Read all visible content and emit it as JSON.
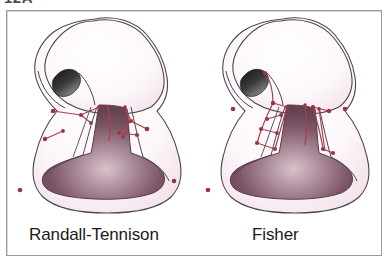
{
  "figure": {
    "caption_fragment": "12A",
    "border_color": "#9a9a9e",
    "background_color": "#ffffff"
  },
  "panels": [
    {
      "id": "randall-tennison",
      "label": "Randall-Tennison",
      "side": "left"
    },
    {
      "id": "fisher",
      "label": "Fisher",
      "side": "right"
    }
  ],
  "illustration": {
    "subject": "cleft lip repair surgical markings on nose and upper lip",
    "colors": {
      "outline": "#4a4350",
      "skin_fill": "#fdf8fa",
      "skin_shadow": "#f3e6ec",
      "oral_cavity_dark": "#6d4a58",
      "oral_cavity_light": "#cfb7c2",
      "nostril": "#2c2c2c",
      "marking_line": "#a8414d",
      "marking_dot": "#9c3340"
    },
    "parts": [
      {
        "name": "nasal-dome",
        "description": "rounded nasal tip and ala outline"
      },
      {
        "name": "nostril",
        "description": "dark left nostril opening"
      },
      {
        "name": "oral-cavity",
        "description": "shaded mouth opening with gradient"
      },
      {
        "name": "vermilion-border",
        "description": "lip margin outline"
      },
      {
        "name": "surgical-markings",
        "description": "red incision lines with point dots"
      }
    ]
  }
}
